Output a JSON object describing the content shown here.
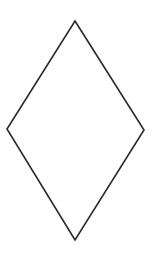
{
  "diagram": {
    "shape": "rhombus",
    "vertices": [
      {
        "name": "top",
        "x": 75,
        "y": 21
      },
      {
        "name": "right",
        "x": 144,
        "y": 130
      },
      {
        "name": "bottom",
        "x": 75,
        "y": 240
      },
      {
        "name": "left",
        "x": 7,
        "y": 129
      }
    ],
    "points": "75,21 144,130 75,240 7,129",
    "stroke_color": "#2a2a2a",
    "fill_color": "#ffffff",
    "stroke_width": "1.6"
  }
}
